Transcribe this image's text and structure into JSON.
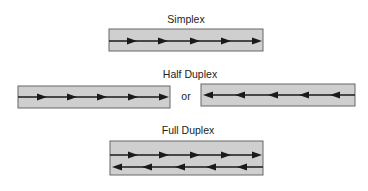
{
  "title_simplex": "Simplex",
  "title_half_duplex": "Half Duplex",
  "title_full_duplex": "Full Duplex",
  "or_label": "or",
  "colors": {
    "channel_fill": "#cfcfcf",
    "channel_border": "#555555",
    "line": "#1a1a1a"
  },
  "diagrams": [
    {
      "name": "simplex",
      "direction": [
        "left-to-right"
      ]
    },
    {
      "name": "half-duplex",
      "direction": [
        "left-to-right",
        "or",
        "right-to-left"
      ]
    },
    {
      "name": "full-duplex",
      "direction": [
        "left-to-right",
        "right-to-left"
      ]
    }
  ]
}
